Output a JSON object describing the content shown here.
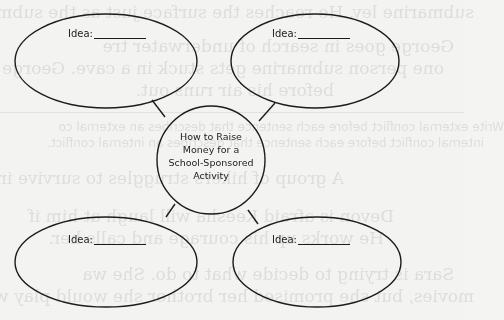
{
  "worksheet": {
    "central_topic": {
      "lines": [
        "How to Raise",
        "Money for a",
        "School-Sponsored",
        "Activity"
      ]
    },
    "idea_bubbles": [
      {
        "position": "top-left",
        "label": "Idea:",
        "value": ""
      },
      {
        "position": "top-right",
        "label": "Idea:",
        "value": ""
      },
      {
        "position": "bottom-left",
        "label": "Idea:",
        "value": ""
      },
      {
        "position": "bottom-right",
        "label": "Idea:",
        "value": ""
      }
    ],
    "colors": {
      "paper": "#f3f3f1",
      "ink": "#1c1c1c",
      "bleed_through": "#d6d6d4"
    }
  },
  "bleed_through_text": {
    "lines": [
      "submarine lev. He reaches the surface just as the submarine r",
      "George goes in search of underwater tre",
      "one person submarine gets stuck in a cave. George struggles",
      "before his air runs out.",
      "Write external conflict before each sentence that describes an external co",
      "internal conflict before each sentence that describes an internal conflict.",
      "A group of hikers struggles to survive in a",
      "Devon is afraid Keesha will laugh at him if",
      "He works up his courage and calls her.",
      "Sara is trying to decide what to do. She wa",
      "movies, but she promised her brother she would play with h"
    ]
  }
}
